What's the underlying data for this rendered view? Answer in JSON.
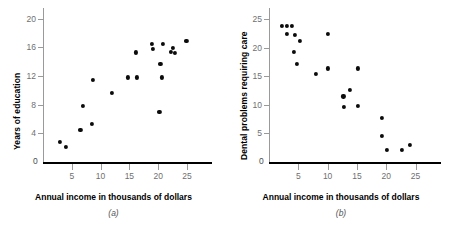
{
  "figure": {
    "panels": [
      {
        "caption": "(a)",
        "xlabel": "Annual income in thousands of dollars",
        "ylabel": "Years of education"
      },
      {
        "caption": "(b)",
        "xlabel": "Annual income in thousands of dollars",
        "ylabel": "Dental problems requiring care"
      }
    ],
    "colors": {
      "marker": "#0b0b0b",
      "axis_x": "#000000",
      "axis_y": "#9a9a9a",
      "ticklabel": "#6f6f6f",
      "title": "#000000",
      "caption": "#555555",
      "background": "#ffffff"
    }
  },
  "chart_data": [
    {
      "type": "scatter",
      "title": "",
      "panel": "(a)",
      "xlabel": "Annual income in thousands of dollars",
      "ylabel": "Years of education",
      "xlim": [
        0,
        29
      ],
      "ylim": [
        0,
        21.5
      ],
      "xticks": [
        5,
        10,
        15,
        20,
        25
      ],
      "yticks": [
        4,
        8,
        12,
        16,
        20
      ],
      "xticklabels": [
        "5",
        "10",
        "15",
        "20",
        "25"
      ],
      "yticklabels": [
        "4",
        "8",
        "12",
        "16",
        "20"
      ],
      "origin_label": "0",
      "grid": false,
      "legend": false,
      "points": [
        {
          "x": 3.0,
          "y": 2.8
        },
        {
          "x": 4.0,
          "y": 2.1
        },
        {
          "x": 6.5,
          "y": 4.5
        },
        {
          "x": 7.0,
          "y": 7.8
        },
        {
          "x": 8.5,
          "y": 5.3
        },
        {
          "x": 8.6,
          "y": 11.5
        },
        {
          "x": 11.9,
          "y": 9.6
        },
        {
          "x": 14.7,
          "y": 11.8
        },
        {
          "x": 16.3,
          "y": 11.8
        },
        {
          "x": 16.1,
          "y": 15.3
        },
        {
          "x": 18.9,
          "y": 16.5
        },
        {
          "x": 19.1,
          "y": 15.8
        },
        {
          "x": 20.2,
          "y": 7.0
        },
        {
          "x": 20.6,
          "y": 11.8
        },
        {
          "x": 20.4,
          "y": 13.7
        },
        {
          "x": 20.8,
          "y": 16.5
        },
        {
          "x": 22.2,
          "y": 15.4
        },
        {
          "x": 22.6,
          "y": 15.9
        },
        {
          "x": 22.9,
          "y": 15.2
        },
        {
          "x": 24.9,
          "y": 16.9
        }
      ]
    },
    {
      "type": "scatter",
      "title": "",
      "panel": "(b)",
      "xlabel": "Annual income in thousands of dollars",
      "ylabel": "Dental problems requiring care",
      "xlim": [
        0,
        29
      ],
      "ylim": [
        0,
        27
      ],
      "xticks": [
        5,
        10,
        15,
        20,
        25
      ],
      "yticks": [
        5,
        10,
        15,
        20,
        25
      ],
      "xticklabels": [
        "5",
        "10",
        "15",
        "20",
        "25"
      ],
      "yticklabels": [
        "5",
        "10",
        "15",
        "20",
        "25"
      ],
      "origin_label": "0",
      "grid": false,
      "legend": false,
      "points": [
        {
          "x": 2.2,
          "y": 23.8
        },
        {
          "x": 3.1,
          "y": 23.8
        },
        {
          "x": 3.9,
          "y": 23.8
        },
        {
          "x": 3.0,
          "y": 22.4
        },
        {
          "x": 4.4,
          "y": 22.3
        },
        {
          "x": 5.3,
          "y": 21.2
        },
        {
          "x": 4.3,
          "y": 19.3
        },
        {
          "x": 4.7,
          "y": 17.2
        },
        {
          "x": 8.0,
          "y": 15.4
        },
        {
          "x": 10.0,
          "y": 22.5
        },
        {
          "x": 10.1,
          "y": 16.4
        },
        {
          "x": 12.7,
          "y": 11.5
        },
        {
          "x": 12.8,
          "y": 9.6
        },
        {
          "x": 13.8,
          "y": 12.6
        },
        {
          "x": 15.1,
          "y": 16.4
        },
        {
          "x": 15.2,
          "y": 9.8
        },
        {
          "x": 19.3,
          "y": 7.8
        },
        {
          "x": 19.2,
          "y": 4.6
        },
        {
          "x": 20.1,
          "y": 2.1
        },
        {
          "x": 22.7,
          "y": 2.1
        },
        {
          "x": 24.0,
          "y": 3.0
        }
      ]
    }
  ]
}
